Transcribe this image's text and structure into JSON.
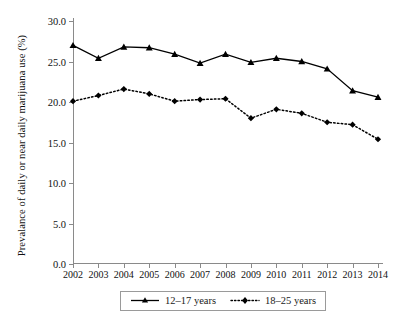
{
  "chart_data": {
    "type": "line",
    "title": "",
    "xlabel": "",
    "ylabel": "Prevalance of daily or near daily marijuana use (%)",
    "categories": [
      "2002",
      "2003",
      "2004",
      "2005",
      "2006",
      "2007",
      "2008",
      "2009",
      "2010",
      "2011",
      "2012",
      "2013",
      "2014"
    ],
    "x": [
      2002,
      2003,
      2004,
      2005,
      2006,
      2007,
      2008,
      2009,
      2010,
      2011,
      2012,
      2013,
      2014
    ],
    "xlim": [
      2002,
      2014
    ],
    "ylim": [
      0.0,
      30.0
    ],
    "yticks": [
      "0.0",
      "5.0",
      "10.0",
      "15.0",
      "20.0",
      "25.0",
      "30.0"
    ],
    "ytick_values": [
      0.0,
      5.0,
      10.0,
      15.0,
      20.0,
      25.0,
      30.0
    ],
    "grid": false,
    "legend_position": "bottom-center",
    "series": [
      {
        "name": "12–17 years",
        "marker": "triangle",
        "linestyle": "solid",
        "color": "#000000",
        "values": [
          27.0,
          25.4,
          26.8,
          26.7,
          25.9,
          24.8,
          25.9,
          24.9,
          25.4,
          25.0,
          24.1,
          21.4,
          20.6
        ]
      },
      {
        "name": "18–25 years",
        "marker": "diamond",
        "linestyle": "dotted",
        "color": "#000000",
        "values": [
          20.1,
          20.8,
          21.6,
          21.0,
          20.1,
          20.3,
          20.4,
          18.0,
          19.1,
          18.6,
          17.5,
          17.2,
          15.4
        ]
      }
    ]
  },
  "legend": {
    "entries": [
      {
        "label": "12–17 years"
      },
      {
        "label": "18–25 years"
      }
    ]
  }
}
